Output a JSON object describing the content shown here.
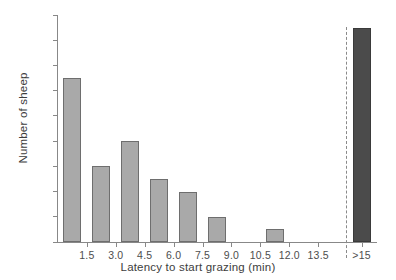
{
  "chart_data": {
    "type": "bar",
    "title": "",
    "subtitle": "",
    "xlabel": "Latency to start grazing (min)",
    "ylabel": "Number of sheep",
    "categories": [
      "0.0-1.5",
      "1.5-3.0",
      "3.0-4.5",
      "4.5-6.0",
      "6.0-7.5",
      "7.5-9.0",
      "9.0-10.5",
      "10.5-12.0",
      "12.0-13.5",
      "13.5-15.0",
      ">15"
    ],
    "values": [
      13,
      6,
      8,
      5,
      4,
      2,
      0,
      1,
      0,
      0,
      17
    ],
    "bar_colors": [
      "#a9a9a9",
      "#a9a9a9",
      "#a9a9a9",
      "#a9a9a9",
      "#a9a9a9",
      "#a9a9a9",
      "#a9a9a9",
      "#a9a9a9",
      "#a9a9a9",
      "#a9a9a9",
      "#4b4b4b"
    ],
    "ylim": [
      0,
      18
    ],
    "ytick_values": [
      0,
      2,
      4,
      6,
      8,
      10,
      12,
      14,
      16,
      18
    ],
    "ytick_labels": [
      "0",
      "2",
      "4",
      "6",
      "8",
      "10",
      "12",
      "14",
      "16",
      "18"
    ],
    "xtick_labels": [
      "1.5",
      "3.0",
      "4.5",
      "6.0",
      "7.5",
      "9.0",
      "10.5",
      "12.0",
      "13.5",
      ">15"
    ],
    "xtick_positions": [
      1,
      2,
      3,
      4,
      5,
      6,
      7,
      8,
      9,
      10.5
    ],
    "grid": false,
    "legend": null,
    "annotations": [
      {
        "name": "threshold-dashed-line",
        "type": "vline",
        "position": 9.95,
        "style": "dashed",
        "color": "#8a8a8a"
      }
    ],
    "axis_color": "#888888",
    "text_color": "#3d3d3d"
  }
}
